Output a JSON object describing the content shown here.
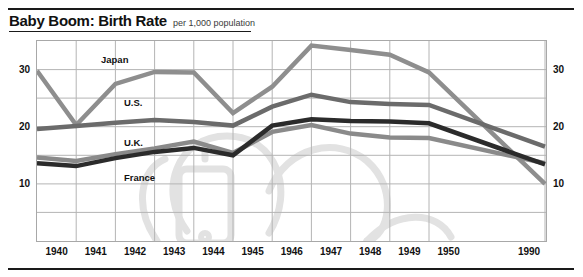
{
  "header": {
    "title": "Baby Boom: Birth Rate",
    "subtitle": "per 1,000 population"
  },
  "chart_data": {
    "type": "line",
    "title": "Baby Boom: Birth Rate",
    "subtitle": "per 1,000 population",
    "xlabel": "",
    "ylabel": "per 1,000 population",
    "categories": [
      "1940",
      "1941",
      "1942",
      "1943",
      "1944",
      "1945",
      "1946",
      "1947",
      "1948",
      "1949",
      "1950",
      "1990"
    ],
    "x_tick_labels": [
      "1940",
      "1941",
      "1942",
      "1943",
      "1944",
      "1945",
      "1946",
      "1947",
      "1948",
      "1949",
      "1950",
      "1990"
    ],
    "y_tick_labels": [
      "10",
      "20",
      "30"
    ],
    "y_tick_labels_right": [
      "10",
      "20",
      "30"
    ],
    "ylim": [
      0,
      35
    ],
    "grid": true,
    "grid_step": 5,
    "legend": "inline-labels",
    "series": [
      {
        "name": "Japan",
        "color": "#8e8e8e",
        "values": [
          29.8,
          20.3,
          27.5,
          29.6,
          29.5,
          22.4,
          27.0,
          34.2,
          33.4,
          32.6,
          29.5,
          10.0
        ]
      },
      {
        "name": "U.S.",
        "color": "#6b6b6b",
        "values": [
          19.6,
          20.1,
          20.7,
          21.2,
          20.8,
          20.2,
          23.5,
          25.6,
          24.3,
          24.0,
          23.8,
          16.5
        ]
      },
      {
        "name": "U.K.",
        "color": "#8a8a8a",
        "values": [
          14.6,
          14.0,
          15.2,
          16.2,
          17.4,
          15.4,
          19.1,
          20.3,
          18.8,
          18.1,
          18.0,
          13.6
        ]
      },
      {
        "name": "France",
        "color": "#2b2b2b",
        "values": [
          13.6,
          13.1,
          14.5,
          15.6,
          16.3,
          15.0,
          20.2,
          21.3,
          21.0,
          20.9,
          20.6,
          13.4
        ]
      }
    ]
  },
  "watermark": {
    "name": "baby-rattle-illustration",
    "color": "#e2e2e2"
  }
}
